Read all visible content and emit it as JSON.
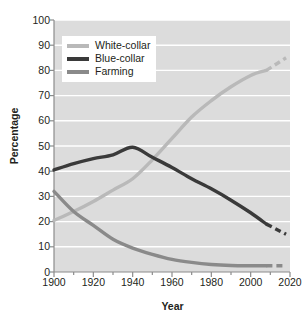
{
  "chart_data": {
    "type": "line",
    "title": "",
    "xlabel": "Year",
    "ylabel": "Percentage",
    "xlim": [
      1900,
      2020
    ],
    "ylim": [
      0,
      100
    ],
    "grid": true,
    "legend_position": "top-left",
    "xticks": [
      1900,
      1920,
      1940,
      1960,
      1980,
      2000,
      2020
    ],
    "xticks_minor": [
      1910,
      1930,
      1950,
      1970,
      1990,
      2010
    ],
    "yticks": [
      0,
      10,
      20,
      30,
      40,
      50,
      60,
      70,
      80,
      90,
      100
    ],
    "x": [
      1900,
      1910,
      1920,
      1930,
      1940,
      1950,
      1960,
      1970,
      1980,
      1990,
      2000,
      2008
    ],
    "series": [
      {
        "name": "White-collar",
        "color": "#b9b9b9",
        "values": [
          20.5,
          24.0,
          28.0,
          32.5,
          37.0,
          44.5,
          53.0,
          61.5,
          68.0,
          73.5,
          78.0,
          80.0
        ],
        "projected_x": [
          2008,
          2018
        ],
        "projected_values": [
          80.0,
          85.0
        ],
        "style": "solid-then-dashed"
      },
      {
        "name": "Blue-collar",
        "color": "#3a3a3a",
        "values": [
          40.5,
          43.0,
          45.0,
          46.5,
          49.5,
          45.5,
          41.5,
          37.0,
          33.0,
          28.5,
          23.5,
          19.0
        ],
        "projected_x": [
          2008,
          2018
        ],
        "projected_values": [
          19.0,
          15.0
        ],
        "style": "solid-then-dashed"
      },
      {
        "name": "Farming",
        "color": "#8a8a8a",
        "values": [
          32.0,
          24.0,
          18.5,
          13.0,
          9.5,
          7.0,
          5.0,
          3.8,
          3.0,
          2.6,
          2.5,
          2.5
        ],
        "projected_x": [
          2008,
          2018
        ],
        "projected_values": [
          2.5,
          2.5
        ],
        "style": "solid-then-dashed"
      }
    ]
  },
  "legend": {
    "items": [
      {
        "label": "White-collar",
        "color": "#b9b9b9"
      },
      {
        "label": "Blue-collar",
        "color": "#3a3a3a"
      },
      {
        "label": "Farming",
        "color": "#8a8a8a"
      }
    ]
  },
  "axes": {
    "y_title": "Percentage",
    "x_title": "Year",
    "y_tick_labels": [
      "0",
      "10",
      "20",
      "30",
      "40",
      "50",
      "60",
      "70",
      "80",
      "90",
      "100"
    ],
    "x_tick_labels": [
      "1900",
      "1920",
      "1940",
      "1960",
      "1980",
      "2000",
      "2020"
    ]
  },
  "style": {
    "plot_background": "#dcdcdc",
    "gridline_color": "#ffffff",
    "axis_color": "#8c8c8c",
    "text_color": "#231f20",
    "page_background": "#ffffff"
  },
  "watermark": {
    "text": ""
  }
}
